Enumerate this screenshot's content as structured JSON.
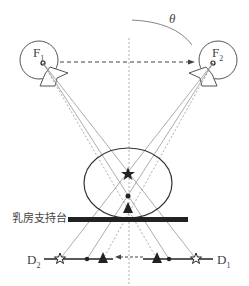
{
  "diagram": {
    "angle_label": "θ",
    "source_left": {
      "label": "F",
      "sub": "1"
    },
    "source_right": {
      "label": "F",
      "sub": "2"
    },
    "detector_left": {
      "label": "D",
      "sub": "2"
    },
    "detector_right": {
      "label": "D",
      "sub": "1"
    },
    "support_label": "乳房支持台",
    "markers": [
      "star",
      "dot",
      "triangle"
    ],
    "colors": {
      "line": "#555555",
      "ray": "#888888",
      "solid": "#222222"
    }
  }
}
